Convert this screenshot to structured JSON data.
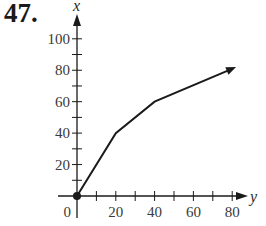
{
  "problem": {
    "number": "47."
  },
  "chart_data": {
    "type": "line",
    "title": "",
    "xlabel": "y",
    "ylabel": "x",
    "x": [
      0,
      20,
      40,
      82
    ],
    "series": [
      {
        "name": "graph",
        "values": [
          0,
          40,
          60,
          82
        ]
      }
    ],
    "xlim": [
      0,
      90
    ],
    "ylim": [
      0,
      110
    ],
    "x_ticks": [
      0,
      20,
      40,
      60,
      80
    ],
    "y_ticks": [
      20,
      40,
      60,
      80,
      100
    ],
    "x_minor_step": 10,
    "y_minor_step": 10,
    "grid": false,
    "annotations": [
      "filled dot at origin (0,0)",
      "arrow at end of curve"
    ],
    "origin_label": "0"
  },
  "colors": {
    "ink": "#1a1a1a",
    "tick_text": "#3a3a3a"
  }
}
